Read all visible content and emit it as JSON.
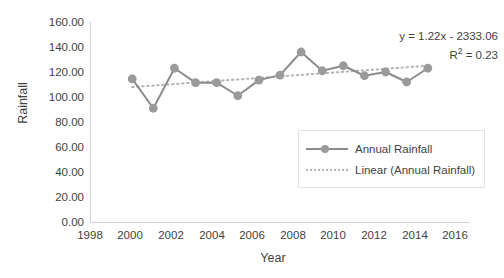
{
  "chart_data": {
    "type": "line",
    "title": "",
    "xlabel": "Year",
    "ylabel": "Rainfall",
    "xlim": [
      1998,
      2016
    ],
    "ylim": [
      0,
      160
    ],
    "grid": false,
    "legend_position": "inside-right",
    "x": [
      2000,
      2001,
      2002,
      2003,
      2004,
      2005,
      2006,
      2007,
      2008,
      2009,
      2010,
      2011,
      2012,
      2013,
      2014
    ],
    "series": [
      {
        "name": "Annual Rainfall",
        "type": "line",
        "marker": "circle",
        "color": "#8c8c8c",
        "values": [
          114.5,
          91.0,
          123.0,
          111.5,
          111.5,
          101.0,
          113.5,
          117.5,
          136.0,
          121.0,
          125.0,
          117.0,
          120.0,
          112.0,
          123.0
        ]
      },
      {
        "name": "Linear (Annual Rainfall)",
        "type": "trendline",
        "style": "dotted",
        "color": "#b4b4b4",
        "slope": 1.22,
        "intercept": -2333.06,
        "r_squared": 0.23,
        "endpoints": [
          {
            "x": 2000,
            "y": 107.94
          },
          {
            "x": 2014,
            "y": 125.02
          }
        ]
      }
    ],
    "annotations": [
      "y = 1.22x - 2333.06",
      "R² = 0.23"
    ],
    "x_tick_labels": [
      "1998",
      "2000",
      "2002",
      "2004",
      "2006",
      "2008",
      "2010",
      "2012",
      "2014",
      "2016"
    ],
    "y_tick_labels": [
      "160.00",
      "140.00",
      "120.00",
      "100.00",
      "80.00",
      "60.00",
      "40.00",
      "20.00",
      "0.00"
    ],
    "y_tick_values": [
      160,
      140,
      120,
      100,
      80,
      60,
      40,
      20,
      0
    ]
  },
  "axes": {
    "y_title": "Rainfall",
    "x_title": "Year",
    "y_ticks": [
      "160.00",
      "140.00",
      "120.00",
      "100.00",
      "80.00",
      "60.00",
      "40.00",
      "20.00",
      "0.00"
    ],
    "x_ticks": [
      "1998",
      "2000",
      "2002",
      "2004",
      "2006",
      "2008",
      "2010",
      "2012",
      "2014",
      "2016"
    ]
  },
  "annotation": {
    "equation": "y = 1.22x - 2333.06",
    "r_squared_prefix": "R",
    "r_squared_sup": "2",
    "r_squared_value": " = 0.23"
  },
  "legend": {
    "items": [
      {
        "label": "Annual Rainfall",
        "style": "line-marker"
      },
      {
        "label": "Linear (Annual Rainfall)",
        "style": "dotted"
      }
    ]
  },
  "colors": {
    "series_line": "#8c8c8c",
    "series_marker": "#9a9a9a",
    "trendline": "#b4b4b4",
    "axis": "#d0d0d0",
    "text": "#3f3f3f",
    "background": "#ffffff"
  }
}
